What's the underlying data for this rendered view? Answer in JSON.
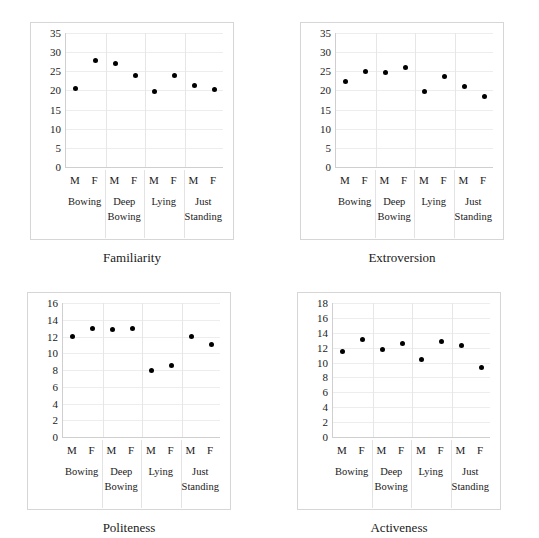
{
  "figure": {
    "background": "#ffffff",
    "dot_color": "#000000",
    "grid_color": "#ededed",
    "panel_border_color": "#d6d6d6",
    "group_labels": [
      "Bowing",
      "Deep Bowing",
      "Lying",
      "Just Standing"
    ],
    "sex_labels": [
      "M",
      "F",
      "M",
      "F",
      "M",
      "F",
      "M",
      "F"
    ],
    "panel_count": 4
  },
  "chart_data": [
    {
      "type": "scatter",
      "title": "Familiarity",
      "xlabel": "",
      "ylabel": "",
      "ylim": [
        0,
        35
      ],
      "yticks": [
        0,
        5,
        10,
        15,
        20,
        25,
        30,
        35
      ],
      "grid": true,
      "legend": "none",
      "categories": [
        "Bowing",
        "Deep Bowing",
        "Lying",
        "Just Standing"
      ],
      "x": [
        "M",
        "F",
        "M",
        "F",
        "M",
        "F",
        "M",
        "F"
      ],
      "values": [
        20.4,
        27.8,
        27.1,
        23.8,
        19.6,
        23.9,
        21.4,
        20.2
      ]
    },
    {
      "type": "scatter",
      "title": "Extroversion",
      "xlabel": "",
      "ylabel": "",
      "ylim": [
        0,
        35
      ],
      "yticks": [
        0,
        5,
        10,
        15,
        20,
        25,
        30,
        35
      ],
      "grid": true,
      "legend": "none",
      "categories": [
        "Bowing",
        "Deep Bowing",
        "Lying",
        "Just Standing"
      ],
      "x": [
        "M",
        "F",
        "M",
        "F",
        "M",
        "F",
        "M",
        "F"
      ],
      "values": [
        22.4,
        24.9,
        24.6,
        25.9,
        19.7,
        23.7,
        20.9,
        18.5
      ]
    },
    {
      "type": "scatter",
      "title": "Politeness",
      "xlabel": "",
      "ylabel": "",
      "ylim": [
        0,
        16
      ],
      "yticks": [
        0,
        2,
        4,
        6,
        8,
        10,
        12,
        14,
        16
      ],
      "grid": true,
      "legend": "none",
      "categories": [
        "Bowing",
        "Deep Bowing",
        "Lying",
        "Just Standing"
      ],
      "x": [
        "M",
        "F",
        "M",
        "F",
        "M",
        "F",
        "M",
        "F"
      ],
      "values": [
        12.0,
        13.0,
        12.8,
        13.0,
        8.0,
        8.5,
        12.0,
        11.1
      ]
    },
    {
      "type": "scatter",
      "title": "Activeness",
      "xlabel": "",
      "ylabel": "",
      "ylim": [
        0,
        18
      ],
      "yticks": [
        0,
        2,
        4,
        6,
        8,
        10,
        12,
        14,
        16,
        18
      ],
      "grid": true,
      "legend": "none",
      "categories": [
        "Bowing",
        "Deep Bowing",
        "Lying",
        "Just Standing"
      ],
      "x": [
        "M",
        "F",
        "M",
        "F",
        "M",
        "F",
        "M",
        "F"
      ],
      "values": [
        11.5,
        13.1,
        11.7,
        12.6,
        10.4,
        12.8,
        12.3,
        9.3
      ]
    }
  ]
}
